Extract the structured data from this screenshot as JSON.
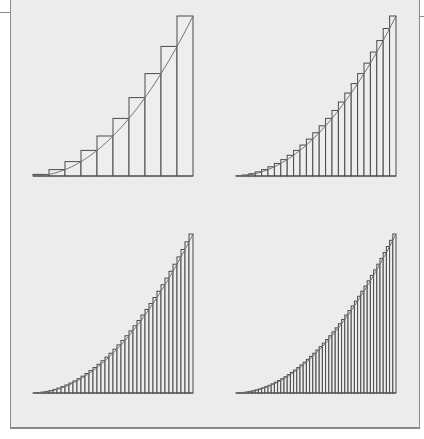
{
  "figure": {
    "colors": {
      "background": "#ececec",
      "rect_fill": "#eeeeee",
      "rect_stroke": "#4a4a4a",
      "curve": "#6e6e6e"
    },
    "panels": [
      {
        "id": "top-left",
        "n": 10,
        "x0": 33,
        "x1": 193,
        "baseline": 176,
        "top": 16
      },
      {
        "id": "top-right",
        "n": 25,
        "x0": 236,
        "x1": 396,
        "baseline": 176,
        "top": 16
      },
      {
        "id": "bottom-left",
        "n": 40,
        "x0": 33,
        "x1": 193,
        "baseline": 393,
        "top": 234
      },
      {
        "id": "bottom-right",
        "n": 50,
        "x0": 236,
        "x1": 396,
        "baseline": 393,
        "top": 234
      }
    ]
  }
}
